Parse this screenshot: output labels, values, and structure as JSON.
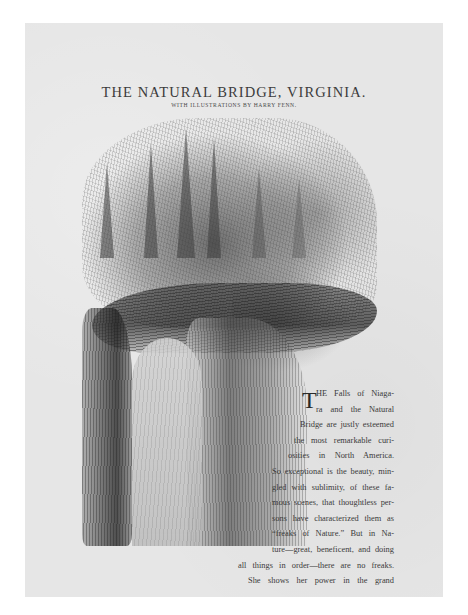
{
  "page": {
    "title": "THE NATURAL BRIDGE, VIRGINIA.",
    "subtitle": "WITH ILLUSTRATIONS BY HARRY FENN.",
    "illustration": {
      "subject": "Engraving of the Natural Bridge, Virginia — rock arch with trees on top"
    },
    "body": {
      "drop_cap": "T",
      "lines": [
        "HE Falls of Niaga-",
        "ra and the Natural",
        "Bridge are justly esteemed",
        "the most remarkable curi-",
        "osities in North America.",
        "So exceptional is the beauty, min-",
        "gled with sublimity, of these fa-",
        "mous scenes, that thoughtless per-",
        "sons have characterized them as",
        "“freaks of Nature.” But in Na-",
        "ture—great, beneficent, and doing",
        "all things in order—there are no freaks.",
        "She shows her power in the grand"
      ]
    }
  }
}
